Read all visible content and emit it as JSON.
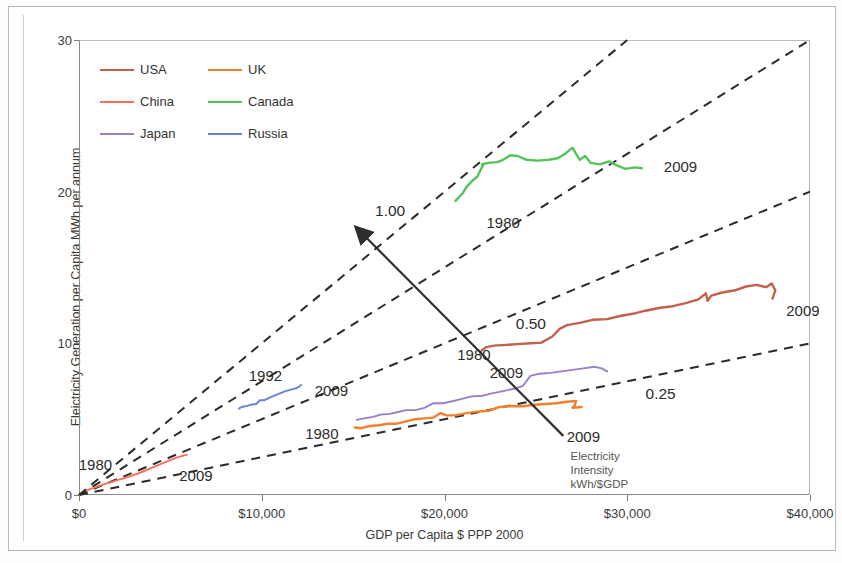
{
  "axes": {
    "x_title": "GDP per Capita $ PPP 2000",
    "y_title": "Eleictricity Generation per Capita MWh per annum",
    "x_ticks": [
      "$0",
      "$10,000",
      "$20,000",
      "$30,000",
      "$40,000"
    ],
    "y_ticks": [
      "0",
      "10",
      "20",
      "30"
    ]
  },
  "legend": {
    "items": [
      {
        "label": "USA",
        "color": "#c1604b"
      },
      {
        "label": "UK",
        "color": "#f0802b"
      },
      {
        "label": "China",
        "color": "#f4705c"
      },
      {
        "label": "Canada",
        "color": "#56c25c"
      },
      {
        "label": "Japan",
        "color": "#9b7fc6"
      },
      {
        "label": "Russia",
        "color": "#6e80d2"
      }
    ]
  },
  "annotations": {
    "ratio_100": "1.00",
    "ratio_050": "0.50",
    "ratio_025": "0.25",
    "intensity_line1": "Electricity",
    "intensity_line2": "Intensity",
    "intensity_line3": "kWh/$GDP",
    "canada_start": "1980",
    "canada_end": "2009",
    "usa_start": "1980",
    "usa_end": "2009",
    "china_start": "1980",
    "china_end": "2009",
    "russia_start": "1992",
    "russia_end": "2009",
    "ukjapan_start": "1980",
    "japan_end": "2009",
    "uk_end": "2009"
  },
  "chart_data": {
    "type": "line",
    "title": "",
    "xlabel": "GDP per Capita $ PPP 2000",
    "ylabel": "Eleictricity Generation per Capita MWh per annum",
    "xlim": [
      0,
      40000
    ],
    "ylim": [
      0,
      30
    ],
    "grid": false,
    "legend_position": "top-left",
    "reference_rays": [
      {
        "label": "1.00",
        "slope_kwh_per_dollar": 1.0
      },
      {
        "label": "0.75",
        "slope_kwh_per_dollar": 0.75
      },
      {
        "label": "0.50",
        "slope_kwh_per_dollar": 0.5
      },
      {
        "label": "0.25",
        "slope_kwh_per_dollar": 0.25
      }
    ],
    "arrow_annotation": {
      "text": "Electricity Intensity kWh/$GDP",
      "from": [
        26500,
        3.9
      ],
      "to": [
        15200,
        17.6
      ]
    },
    "series": [
      {
        "name": "USA",
        "color": "#c1604b",
        "start_label": "1980",
        "end_label": "2009",
        "points": [
          [
            22050,
            9.55
          ],
          [
            22300,
            9.75
          ],
          [
            22700,
            9.85
          ],
          [
            23400,
            9.9
          ],
          [
            24000,
            9.95
          ],
          [
            24700,
            10.0
          ],
          [
            25300,
            10.05
          ],
          [
            25900,
            10.45
          ],
          [
            26300,
            10.95
          ],
          [
            26700,
            11.2
          ],
          [
            27400,
            11.35
          ],
          [
            28100,
            11.55
          ],
          [
            28900,
            11.6
          ],
          [
            29600,
            11.8
          ],
          [
            30300,
            11.95
          ],
          [
            31000,
            12.15
          ],
          [
            31800,
            12.35
          ],
          [
            32500,
            12.45
          ],
          [
            33200,
            12.65
          ],
          [
            33900,
            12.9
          ],
          [
            34300,
            13.3
          ],
          [
            34400,
            12.8
          ],
          [
            34600,
            13.15
          ],
          [
            35200,
            13.35
          ],
          [
            35900,
            13.5
          ],
          [
            36500,
            13.75
          ],
          [
            37100,
            13.85
          ],
          [
            37600,
            13.7
          ],
          [
            37900,
            13.95
          ],
          [
            38100,
            13.5
          ],
          [
            37950,
            12.95
          ]
        ]
      },
      {
        "name": "Canada",
        "color": "#56c25c",
        "start_label": "1980",
        "end_label": "2009",
        "points": [
          [
            20600,
            19.4
          ],
          [
            21000,
            19.9
          ],
          [
            21200,
            20.3
          ],
          [
            21500,
            20.7
          ],
          [
            21800,
            21.0
          ],
          [
            22000,
            21.5
          ],
          [
            22150,
            21.85
          ],
          [
            22050,
            21.8
          ],
          [
            22400,
            21.9
          ],
          [
            22900,
            21.95
          ],
          [
            23200,
            22.1
          ],
          [
            23600,
            22.4
          ],
          [
            24000,
            22.35
          ],
          [
            24500,
            22.1
          ],
          [
            25100,
            22.05
          ],
          [
            25700,
            22.1
          ],
          [
            26200,
            22.2
          ],
          [
            26600,
            22.5
          ],
          [
            27000,
            22.9
          ],
          [
            27200,
            22.5
          ],
          [
            27400,
            22.1
          ],
          [
            27700,
            22.35
          ],
          [
            28000,
            21.9
          ],
          [
            28500,
            21.8
          ],
          [
            29000,
            22.0
          ],
          [
            29400,
            21.75
          ],
          [
            29900,
            21.5
          ],
          [
            30400,
            21.6
          ],
          [
            30800,
            21.55
          ]
        ]
      },
      {
        "name": "China",
        "color": "#f4705c",
        "start_label": "1980",
        "end_label": "2009",
        "points": [
          [
            420,
            0.3
          ],
          [
            600,
            0.38
          ],
          [
            850,
            0.48
          ],
          [
            1100,
            0.6
          ],
          [
            1400,
            0.72
          ],
          [
            1750,
            0.85
          ],
          [
            2100,
            0.98
          ],
          [
            2500,
            1.12
          ],
          [
            2900,
            1.28
          ],
          [
            3300,
            1.45
          ],
          [
            3700,
            1.65
          ],
          [
            4100,
            1.85
          ],
          [
            4500,
            2.05
          ],
          [
            4900,
            2.25
          ],
          [
            5300,
            2.45
          ],
          [
            5700,
            2.6
          ],
          [
            5900,
            2.65
          ]
        ]
      },
      {
        "name": "Japan",
        "color": "#9b7fc6",
        "start_label": "1980",
        "end_label": "2009",
        "points": [
          [
            15200,
            4.95
          ],
          [
            15600,
            5.05
          ],
          [
            16100,
            5.15
          ],
          [
            16500,
            5.3
          ],
          [
            17000,
            5.35
          ],
          [
            17400,
            5.45
          ],
          [
            17900,
            5.6
          ],
          [
            18400,
            5.6
          ],
          [
            18900,
            5.75
          ],
          [
            19400,
            6.05
          ],
          [
            19900,
            6.05
          ],
          [
            20500,
            6.2
          ],
          [
            21000,
            6.35
          ],
          [
            21500,
            6.5
          ],
          [
            22100,
            6.55
          ],
          [
            22600,
            6.7
          ],
          [
            23200,
            6.85
          ],
          [
            23800,
            7.0
          ],
          [
            24300,
            7.2
          ],
          [
            24700,
            7.85
          ],
          [
            25200,
            8.0
          ],
          [
            25800,
            8.05
          ],
          [
            26400,
            8.15
          ],
          [
            27000,
            8.25
          ],
          [
            27600,
            8.35
          ],
          [
            28200,
            8.45
          ],
          [
            28600,
            8.35
          ],
          [
            28900,
            8.15
          ]
        ]
      },
      {
        "name": "UK",
        "color": "#f0802b",
        "start_label": "1980",
        "end_label": "2009",
        "points": [
          [
            15100,
            4.45
          ],
          [
            15400,
            4.4
          ],
          [
            15900,
            4.55
          ],
          [
            16400,
            4.6
          ],
          [
            16900,
            4.7
          ],
          [
            17400,
            4.7
          ],
          [
            17900,
            4.85
          ],
          [
            18400,
            5.0
          ],
          [
            18900,
            5.05
          ],
          [
            19400,
            5.1
          ],
          [
            19800,
            5.4
          ],
          [
            20100,
            5.25
          ],
          [
            20600,
            5.25
          ],
          [
            21200,
            5.4
          ],
          [
            21800,
            5.5
          ],
          [
            22400,
            5.55
          ],
          [
            23000,
            5.8
          ],
          [
            23600,
            5.85
          ],
          [
            24300,
            5.85
          ],
          [
            24900,
            5.95
          ],
          [
            25500,
            6.0
          ],
          [
            26100,
            6.05
          ],
          [
            26700,
            6.15
          ],
          [
            27200,
            6.2
          ],
          [
            27100,
            5.85
          ],
          [
            27000,
            5.75
          ],
          [
            27500,
            5.8
          ]
        ]
      },
      {
        "name": "Russia",
        "color": "#6e80d2",
        "start_label": "1992",
        "end_label": "2009",
        "points": [
          [
            8750,
            5.7
          ],
          [
            8900,
            5.8
          ],
          [
            9100,
            5.85
          ],
          [
            9400,
            5.95
          ],
          [
            9700,
            6.0
          ],
          [
            9900,
            6.25
          ],
          [
            10150,
            6.25
          ],
          [
            10400,
            6.4
          ],
          [
            10700,
            6.55
          ],
          [
            11000,
            6.7
          ],
          [
            11300,
            6.85
          ],
          [
            11600,
            6.95
          ],
          [
            11900,
            7.05
          ],
          [
            12050,
            7.15
          ],
          [
            12150,
            7.25
          ]
        ]
      }
    ]
  }
}
